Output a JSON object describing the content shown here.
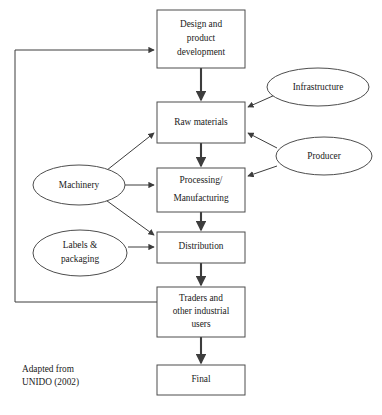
{
  "figure": {
    "type": "flowchart",
    "source_note_lines": [
      "Adapted from",
      "UNIDO (2002)"
    ],
    "background_color": "#ffffff",
    "stroke_color": "#3d3d3d"
  },
  "nodes": {
    "design": {
      "label_lines": [
        "Design and",
        "product",
        "development"
      ],
      "shape": "rectangle"
    },
    "raw_materials": {
      "label_lines": [
        "Raw materials"
      ],
      "shape": "rectangle"
    },
    "processing": {
      "label_lines": [
        "Processing/",
        "Manufacturing"
      ],
      "shape": "rectangle"
    },
    "distribution": {
      "label_lines": [
        "Distribution"
      ],
      "shape": "rectangle"
    },
    "traders": {
      "label_lines": [
        "Traders and",
        "other industrial",
        "users"
      ],
      "shape": "rectangle"
    },
    "final": {
      "label_lines": [
        "Final"
      ],
      "shape": "rectangle"
    },
    "infrastructure": {
      "label_lines": [
        "Infrastructure"
      ],
      "shape": "ellipse"
    },
    "producer": {
      "label_lines": [
        "Producer"
      ],
      "shape": "ellipse"
    },
    "machinery": {
      "label_lines": [
        "Machinery"
      ],
      "shape": "ellipse"
    },
    "labels_packaging": {
      "label_lines": [
        "Labels &",
        "packaging"
      ],
      "shape": "ellipse"
    }
  },
  "edges": [
    {
      "from": "design",
      "to": "raw_materials",
      "style": "thick-arrow"
    },
    {
      "from": "raw_materials",
      "to": "processing",
      "style": "thick-arrow"
    },
    {
      "from": "processing",
      "to": "distribution",
      "style": "thick-arrow"
    },
    {
      "from": "distribution",
      "to": "traders",
      "style": "thick-arrow"
    },
    {
      "from": "traders",
      "to": "final",
      "style": "thick-arrow"
    },
    {
      "from": "infrastructure",
      "to": "raw_materials",
      "style": "thin-arrow"
    },
    {
      "from": "producer",
      "to": "raw_materials",
      "style": "thin-arrow"
    },
    {
      "from": "producer",
      "to": "processing",
      "style": "thin-arrow"
    },
    {
      "from": "machinery",
      "to": "raw_materials",
      "style": "thin-arrow"
    },
    {
      "from": "machinery",
      "to": "processing",
      "style": "thin-arrow"
    },
    {
      "from": "machinery",
      "to": "distribution",
      "style": "thin-arrow"
    },
    {
      "from": "labels_packaging",
      "to": "distribution",
      "style": "thin-arrow"
    },
    {
      "from": "traders",
      "to": "design",
      "style": "thin-arrow-feedback"
    }
  ]
}
